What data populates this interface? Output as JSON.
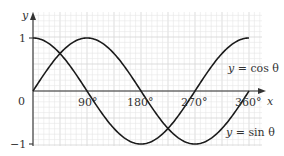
{
  "chart_data": {
    "type": "line",
    "title": "",
    "xlabel": "x",
    "ylabel": "y",
    "x_unit": "degrees",
    "xlim": [
      0,
      360
    ],
    "ylim": [
      -1,
      1
    ],
    "grid": true,
    "x_ticks": [
      0,
      90,
      180,
      270,
      360
    ],
    "x_tick_labels": [
      "0",
      "90°",
      "180°",
      "270°",
      "360°"
    ],
    "y_ticks": [
      -1,
      0,
      1
    ],
    "y_tick_labels": [
      "−1",
      "0",
      "1"
    ],
    "x": [
      0,
      30,
      60,
      90,
      120,
      150,
      180,
      210,
      240,
      270,
      300,
      330,
      360
    ],
    "series": [
      {
        "name": "y = cos θ",
        "values": [
          1,
          0.866,
          0.5,
          0,
          -0.5,
          -0.866,
          -1,
          -0.866,
          -0.5,
          0,
          0.5,
          0.866,
          1
        ]
      },
      {
        "name": "y = sin θ",
        "values": [
          0,
          0.5,
          0.866,
          1,
          0.866,
          0.5,
          0,
          -0.5,
          -0.866,
          -1,
          -0.866,
          -0.5,
          0
        ]
      }
    ],
    "annotations": [
      "y = cos θ",
      "y = sin θ"
    ]
  },
  "labels": {
    "y_axis": "y",
    "x_axis": "x",
    "origin": "0",
    "y_one": "1",
    "y_minus_one": "−1",
    "x90": "90°",
    "x180": "180°",
    "x270": "270°",
    "x360": "360°",
    "cos_label": "y = cos θ",
    "sin_label": "y = sin θ"
  }
}
